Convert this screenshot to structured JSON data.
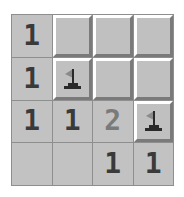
{
  "game": {
    "title": "Minesweeper",
    "rows": 4,
    "cols": 4,
    "colors": {
      "revealed_bg": "#c2c2c2",
      "hidden_bg": "#c0c0c0",
      "grid_line": "#8e8e8e",
      "number_1": "#3a3a3a",
      "number_2": "#7a7a7a",
      "flag": "#2a2a2a"
    },
    "cells": [
      [
        {
          "state": "revealed",
          "value": "1"
        },
        {
          "state": "hidden",
          "value": ""
        },
        {
          "state": "hidden",
          "value": ""
        },
        {
          "state": "hidden",
          "value": ""
        }
      ],
      [
        {
          "state": "revealed",
          "value": "1"
        },
        {
          "state": "flagged",
          "value": ""
        },
        {
          "state": "hidden",
          "value": ""
        },
        {
          "state": "hidden",
          "value": ""
        }
      ],
      [
        {
          "state": "revealed",
          "value": "1"
        },
        {
          "state": "revealed",
          "value": "1"
        },
        {
          "state": "revealed",
          "value": "2"
        },
        {
          "state": "flagged",
          "value": ""
        }
      ],
      [
        {
          "state": "revealed",
          "value": ""
        },
        {
          "state": "revealed",
          "value": ""
        },
        {
          "state": "revealed",
          "value": "1"
        },
        {
          "state": "revealed",
          "value": "1"
        }
      ]
    ]
  }
}
